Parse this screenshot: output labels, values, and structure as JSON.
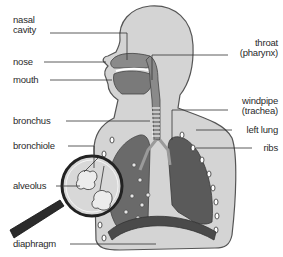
{
  "diagram": {
    "labels_left": [
      {
        "id": "nasal-cavity",
        "line1": "nasal",
        "line2": "cavity"
      },
      {
        "id": "nose",
        "text": "nose"
      },
      {
        "id": "mouth",
        "text": "mouth"
      },
      {
        "id": "bronchus",
        "text": "bronchus"
      },
      {
        "id": "bronchiole",
        "text": "bronchiole"
      },
      {
        "id": "alveolus",
        "text": "alveolus"
      },
      {
        "id": "diaphragm",
        "text": "diaphragm"
      }
    ],
    "labels_right": [
      {
        "id": "throat",
        "line1": "throat",
        "line2": "(pharynx)"
      },
      {
        "id": "windpipe",
        "line1": "windpipe",
        "line2": "(trachea)"
      },
      {
        "id": "left-lung",
        "text": "left lung"
      },
      {
        "id": "ribs",
        "text": "ribs"
      }
    ],
    "colors": {
      "body": "#d4d4d4",
      "outline": "#555555",
      "lung": "#5e5e5e",
      "lung_dark": "#3f3f3f",
      "airway": "#8a8a8a",
      "diaphragm": "#4a4a4a",
      "magnifier_handle": "#2b2b2b",
      "alveolus": "#e8e8e8"
    }
  }
}
